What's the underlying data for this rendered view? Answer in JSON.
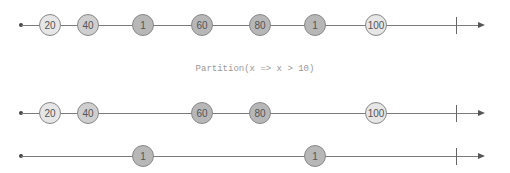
{
  "operator": {
    "label": "Partition(x => x > 10)"
  },
  "timelines": {
    "source": {
      "marbles": [
        {
          "value": "20",
          "x": 50,
          "shade": "light"
        },
        {
          "value": "40",
          "x": 88,
          "shade": "mid"
        },
        {
          "value": "1",
          "x": 143,
          "shade": "dark"
        },
        {
          "value": "60",
          "x": 202,
          "shade": "dark"
        },
        {
          "value": "80",
          "x": 260,
          "shade": "dark"
        },
        {
          "value": "1",
          "x": 315,
          "shade": "dark"
        },
        {
          "value": "100",
          "x": 376,
          "shade": "light"
        }
      ]
    },
    "matching": {
      "marbles": [
        {
          "value": "20",
          "x": 50,
          "shade": "light"
        },
        {
          "value": "40",
          "x": 88,
          "shade": "mid"
        },
        {
          "value": "60",
          "x": 202,
          "shade": "dark"
        },
        {
          "value": "80",
          "x": 260,
          "shade": "dark"
        },
        {
          "value": "100",
          "x": 376,
          "shade": "light"
        }
      ]
    },
    "non_matching": {
      "marbles": [
        {
          "value": "1",
          "x": 143,
          "shade": "dark"
        },
        {
          "value": "1",
          "x": 315,
          "shade": "dark"
        }
      ]
    }
  },
  "colors": {
    "light": "#e6e6e6",
    "mid": "#cfcfcf",
    "dark": "#b7b7b7",
    "line": "#7a7a7a"
  }
}
